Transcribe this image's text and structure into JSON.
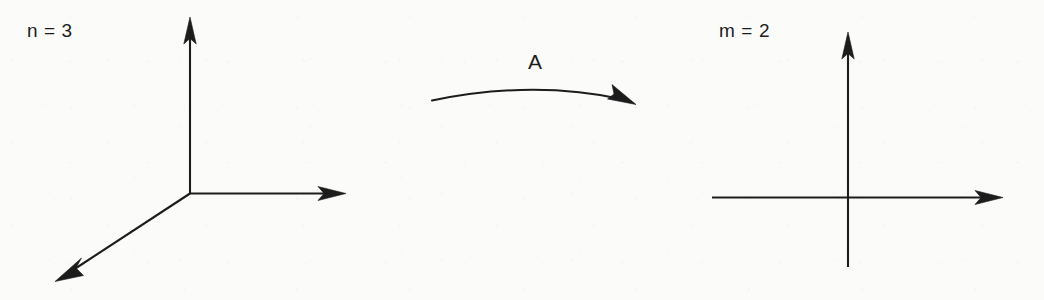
{
  "figure": {
    "type": "diagram",
    "background_color": "#fbfbfa",
    "ink_color": "#1c1c1c",
    "width": 1044,
    "height": 300
  },
  "domain_panel": {
    "label": "n = 3",
    "dimension": 3,
    "origin": {
      "x": 190,
      "y": 193
    },
    "axes": [
      {
        "name": "vertical-axis",
        "from": {
          "x": 190,
          "y": 193
        },
        "to": {
          "x": 190,
          "y": 18
        },
        "arrow": true
      },
      {
        "name": "horizontal-axis",
        "from": {
          "x": 190,
          "y": 193
        },
        "to": {
          "x": 345,
          "y": 193
        },
        "arrow": true
      },
      {
        "name": "depth-axis",
        "from": {
          "x": 190,
          "y": 193
        },
        "to": {
          "x": 57,
          "y": 280
        },
        "arrow": true
      }
    ]
  },
  "map_arrow": {
    "label": "A",
    "start": {
      "x": 432,
      "y": 100
    },
    "control": {
      "x": 533,
      "y": 80
    },
    "end": {
      "x": 634,
      "y": 103
    },
    "direction": "left-to-right",
    "style": "curved"
  },
  "codomain_panel": {
    "label": "m = 2",
    "dimension": 2,
    "origin": {
      "x": 848,
      "y": 197
    },
    "axes": [
      {
        "name": "y-axis",
        "from": {
          "x": 848,
          "y": 267
        },
        "to": {
          "x": 848,
          "y": 33
        },
        "arrow": true
      },
      {
        "name": "x-axis",
        "from": {
          "x": 712,
          "y": 197
        },
        "to": {
          "x": 1002,
          "y": 197
        },
        "arrow": true
      }
    ]
  }
}
